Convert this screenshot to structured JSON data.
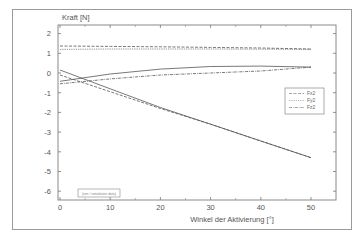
{
  "chart_data": {
    "type": "line",
    "title": "",
    "ylabel": "Kraft [N]",
    "xlabel": "Winkel der Aktivierung [°]",
    "xlim": [
      0,
      53.5
    ],
    "ylim": [
      -6.45,
      2.5
    ],
    "xticks": [
      0,
      10,
      20,
      30,
      40,
      50
    ],
    "xtick_labels": [
      "0",
      "10",
      "20",
      "30",
      "40",
      "50"
    ],
    "yticks": [
      2,
      1,
      0,
      -1,
      -2,
      -3,
      -4,
      -5,
      -6
    ],
    "ytick_labels": [
      "2",
      "1",
      "0",
      "-1",
      "-2",
      "-3",
      "-4",
      "-5",
      "-6"
    ],
    "grid": false,
    "legend": {
      "placement": "right",
      "entries": [
        "Fx2",
        "Fy2",
        "Fz2"
      ]
    },
    "annotation": "(sim / simulation data)",
    "series": [
      {
        "name": "Fx2 (dashed)",
        "style": "dashed",
        "group": "top",
        "x": [
          0,
          10,
          20,
          30,
          40,
          50
        ],
        "y": [
          1.37,
          1.35,
          1.33,
          1.3,
          1.27,
          1.22
        ]
      },
      {
        "name": "Fy2 (dotted)",
        "style": "dotted",
        "group": "top",
        "x": [
          0,
          10,
          20,
          30,
          40,
          50
        ],
        "y": [
          1.2,
          1.22,
          1.22,
          1.22,
          1.21,
          1.2
        ]
      },
      {
        "name": "Fz2 (dash-dot)",
        "style": "dashdot",
        "group": "mid",
        "x": [
          0,
          10,
          20,
          30,
          40,
          50
        ],
        "y": [
          -0.55,
          -0.3,
          -0.1,
          0.0,
          0.1,
          0.3
        ]
      },
      {
        "name": "solid rising",
        "style": "solid",
        "group": "mid",
        "x": [
          0,
          10,
          20,
          30,
          40,
          50
        ],
        "y": [
          -0.42,
          -0.05,
          0.2,
          0.33,
          0.35,
          0.3
        ]
      },
      {
        "name": "dashed falling",
        "style": "dashed",
        "group": "low",
        "x": [
          0,
          10,
          20,
          30,
          40,
          50
        ],
        "y": [
          -0.1,
          -0.95,
          -1.8,
          -2.6,
          -3.45,
          -4.3
        ]
      },
      {
        "name": "solid falling",
        "style": "solid",
        "group": "low",
        "x": [
          0,
          10,
          20,
          30,
          40,
          50
        ],
        "y": [
          0.15,
          -0.8,
          -1.75,
          -2.6,
          -3.45,
          -4.3
        ]
      }
    ]
  }
}
